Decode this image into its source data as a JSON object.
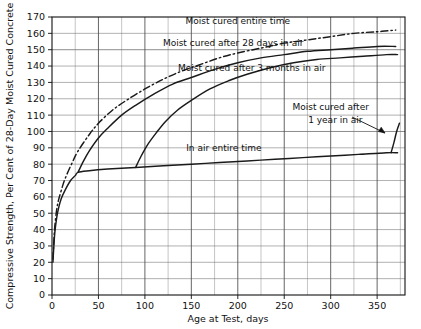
{
  "chart_data": {
    "type": "line",
    "title": "",
    "xlabel": "Age at Test, days",
    "ylabel": "Compressive Strength, Per Cent of 28-Day Moist Cured Concrete",
    "xlim": [
      0,
      380
    ],
    "ylim": [
      0,
      170
    ],
    "grid": true,
    "legend_position": "inline-annotations",
    "xticks": [
      0,
      50,
      100,
      150,
      200,
      250,
      300,
      350
    ],
    "yticks": [
      0,
      10,
      20,
      30,
      40,
      50,
      60,
      70,
      80,
      90,
      100,
      110,
      120,
      130,
      140,
      150,
      160,
      170
    ],
    "xtick_labels": [
      "0",
      "50",
      "100",
      "150",
      "200",
      "250",
      "300",
      "350"
    ],
    "ytick_labels": [
      "0",
      "10",
      "20",
      "30",
      "40",
      "50",
      "60",
      "70",
      "80",
      "90",
      "100",
      "110",
      "120",
      "130",
      "140",
      "150",
      "160",
      "170"
    ],
    "x_minor_step": 25,
    "series": [
      {
        "name": "Moist cured entire time",
        "label": "Moist cured entire time",
        "style": "dash-dot",
        "color": "#1a1a1a",
        "points": [
          [
            1,
            22
          ],
          [
            2,
            33
          ],
          [
            3,
            42
          ],
          [
            5,
            52
          ],
          [
            7,
            58
          ],
          [
            10,
            64
          ],
          [
            14,
            71
          ],
          [
            21,
            80
          ],
          [
            28,
            88
          ],
          [
            40,
            98
          ],
          [
            50,
            105
          ],
          [
            65,
            113
          ],
          [
            80,
            119
          ],
          [
            100,
            126
          ],
          [
            120,
            132
          ],
          [
            140,
            137
          ],
          [
            160,
            141
          ],
          [
            180,
            145
          ],
          [
            200,
            148
          ],
          [
            225,
            151
          ],
          [
            250,
            154
          ],
          [
            275,
            156
          ],
          [
            300,
            158
          ],
          [
            325,
            160
          ],
          [
            350,
            161
          ],
          [
            370,
            162
          ]
        ]
      },
      {
        "name": "Moist cured after 28 days in air",
        "label": "Moist cured after 28 days in air",
        "style": "solid",
        "color": "#1a1a1a",
        "points": [
          [
            28,
            75
          ],
          [
            34,
            82
          ],
          [
            40,
            88
          ],
          [
            50,
            96
          ],
          [
            60,
            102
          ],
          [
            75,
            110
          ],
          [
            90,
            116
          ],
          [
            110,
            123
          ],
          [
            130,
            129
          ],
          [
            150,
            133
          ],
          [
            175,
            138
          ],
          [
            200,
            142
          ],
          [
            225,
            145
          ],
          [
            250,
            147
          ],
          [
            275,
            149
          ],
          [
            300,
            150
          ],
          [
            325,
            151
          ],
          [
            350,
            152
          ],
          [
            370,
            152
          ]
        ]
      },
      {
        "name": "Moist cured after 3 months in air",
        "label": "Moist cured after 3 months in air",
        "style": "solid",
        "color": "#1a1a1a",
        "points": [
          [
            90,
            78
          ],
          [
            96,
            85
          ],
          [
            103,
            92
          ],
          [
            112,
            99
          ],
          [
            122,
            106
          ],
          [
            135,
            113
          ],
          [
            150,
            119
          ],
          [
            170,
            126
          ],
          [
            190,
            131
          ],
          [
            210,
            135
          ],
          [
            235,
            139
          ],
          [
            260,
            142
          ],
          [
            285,
            144
          ],
          [
            310,
            145
          ],
          [
            335,
            146
          ],
          [
            360,
            147
          ],
          [
            372,
            147
          ]
        ]
      },
      {
        "name": "In air entire time",
        "label": "In air entire time",
        "style": "solid",
        "color": "#1a1a1a",
        "points": [
          [
            1,
            20
          ],
          [
            2,
            30
          ],
          [
            3,
            38
          ],
          [
            5,
            47
          ],
          [
            7,
            53
          ],
          [
            10,
            59
          ],
          [
            14,
            64
          ],
          [
            20,
            70
          ],
          [
            25,
            73
          ],
          [
            28,
            75
          ],
          [
            40,
            76
          ],
          [
            60,
            77
          ],
          [
            90,
            78
          ],
          [
            120,
            79
          ],
          [
            150,
            80
          ],
          [
            180,
            81
          ],
          [
            210,
            82
          ],
          [
            240,
            83
          ],
          [
            270,
            84
          ],
          [
            300,
            85
          ],
          [
            330,
            86
          ],
          [
            360,
            87
          ],
          [
            372,
            87
          ]
        ]
      },
      {
        "name": "Moist cured after 1 year in air",
        "label": "Moist cured after 1 year in air",
        "style": "solid",
        "color": "#1a1a1a",
        "points": [
          [
            365,
            87
          ],
          [
            368,
            93
          ],
          [
            371,
            100
          ],
          [
            374,
            105
          ]
        ]
      }
    ],
    "annotations": [
      {
        "text": "Moist cured entire time",
        "x": 200,
        "y": 166
      },
      {
        "text": "Moist cured after 28 days in air",
        "x": 195,
        "y": 152
      },
      {
        "text": "Moist cured after 3 months in air",
        "x": 215,
        "y": 137
      },
      {
        "text": "Moist cured after",
        "x": 300,
        "y": 113
      },
      {
        "text": "1 year in air",
        "x": 305,
        "y": 105
      },
      {
        "text": "In air entire time",
        "x": 185,
        "y": 88
      }
    ]
  }
}
